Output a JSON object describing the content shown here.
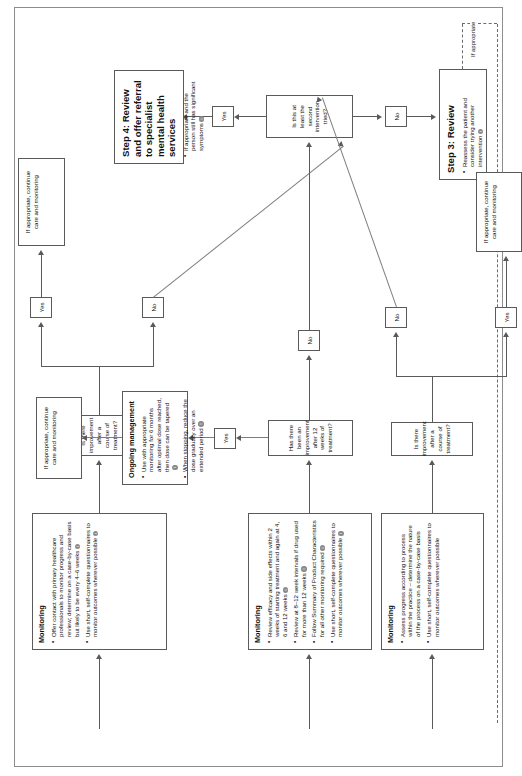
{
  "document": {
    "type": "clinical-pathway-flowchart",
    "orientation": "landscape-rotated",
    "ref_marker": "i"
  },
  "nodes": {
    "monitoring_top": {
      "title": "Monitoring",
      "bullets": [
        "Offer contact with primary healthcare professionals to monitor progress and review; determine on a case-by-case basis but likely to be every 4–6 weeks",
        "Use short, self-complete questionnaires to monitor outcomes wherever possible"
      ]
    },
    "monitoring_mid": {
      "title": "Monitoring",
      "bullets": [
        "Review efficacy and side effects within 2 weeks of starting treatment and again at 4, 6 and 12 weeks",
        "Review at 8–12 week intervals if drug used for more than 12 weeks",
        "Follow Summary of Product Characteristics for all other monitoring required",
        "Use short, self-complete questionnaires to monitor outcomes wherever possible"
      ]
    },
    "monitoring_bottom": {
      "title": "Monitoring",
      "bullets": [
        "Assess progress according to process within the practice – determine the nature of the process on a case-by-case basis",
        "Use short, self-complete questionnaires to monitor outcomes wherever possible"
      ]
    },
    "ongoing_management": {
      "title": "Ongoing management",
      "bullets": [
        "Use with appropriate monitoring for 6 months after optimal dose reached, then dose can be tapered",
        "When stopping, reduce the dose gradually over an extended period"
      ]
    },
    "step4": {
      "title": "Step 4: Review and offer referral to specialist mental health services",
      "bullets": [
        "If appropriate and the person still has significant symptoms"
      ]
    },
    "step3": {
      "title": "Step 3: Review",
      "bullets": [
        "Reassess the patient and consider trying another intervention"
      ]
    },
    "continue_top": {
      "text": "If appropriate, continue care and monitoring"
    },
    "continue_mid": {
      "text": "If appropriate, continue care and monitoring"
    },
    "continue_bottom": {
      "text": "If appropriate, continue care and monitoring"
    }
  },
  "decisions": {
    "q_top": {
      "text": "Is there improvement after a course of treatment?"
    },
    "q_mid": {
      "text": "Has there been an improvement after 12 weeks of treatment?"
    },
    "q_bottom": {
      "text": "Is there improvement after a course of treatment?"
    },
    "q_second": {
      "text": "Is this at least the second intervention tried?"
    }
  },
  "labels": {
    "yes": "Yes",
    "no": "No",
    "if_appropriate": "If appropriate"
  }
}
